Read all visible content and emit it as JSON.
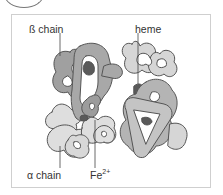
{
  "diagram": {
    "title": "",
    "labels": {
      "beta_chain": "ß chain",
      "heme": "heme",
      "alpha_chain": "α chain",
      "iron_base": "Fe",
      "iron_charge": "2+"
    },
    "colors": {
      "beta_chain_dark": "#9a9a9a",
      "beta_chain_mid": "#b0b0b0",
      "alpha_chain_light": "#d4d4d4",
      "alpha_chain_lighter": "#e2e2e2",
      "heme_group": "#5a5a5a",
      "outline": "#555555",
      "frame_border": "#cfcfcf"
    }
  }
}
